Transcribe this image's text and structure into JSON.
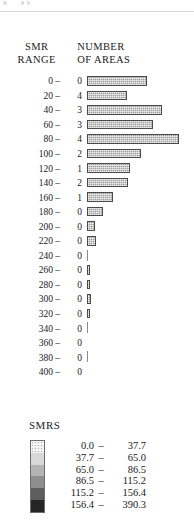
{
  "headers": {
    "smr_range_line1": "SMR",
    "smr_range_line2": "RANGE",
    "number_line1": "NUMBER",
    "number_line2": "OF AREAS"
  },
  "legend": {
    "title": "SMRS",
    "rows": [
      {
        "low": "0.0",
        "dash": "–",
        "high": "37.7",
        "color": "#f2f2f2"
      },
      {
        "low": "37.7",
        "dash": "–",
        "high": "65.0",
        "color": "#d8d8d8"
      },
      {
        "low": "65.0",
        "dash": "–",
        "high": "86.5",
        "color": "#b4b4b4"
      },
      {
        "low": "86.5",
        "dash": "–",
        "high": "115.2",
        "color": "#8e8e8e"
      },
      {
        "low": "115.2",
        "dash": "–",
        "high": "156.4",
        "color": "#5e5e5e"
      },
      {
        "low": "156.4",
        "dash": "–",
        "high": "390.3",
        "color": "#262626"
      }
    ]
  },
  "chart_data": {
    "type": "bar",
    "orientation": "horizontal",
    "title": "",
    "xlabel": "NUMBER OF AREAS",
    "ylabel": "SMR RANGE",
    "xlim": [
      0,
      4
    ],
    "grid": false,
    "legend_position": "bottom",
    "categories": [
      "0 –",
      "20 –",
      "40 –",
      "60 –",
      "80 –",
      "100 –",
      "120 –",
      "140 –",
      "160 –",
      "180 –",
      "200 –",
      "220 –",
      "240 –",
      "260 –",
      "280 –",
      "300 –",
      "320 –",
      "340 –",
      "360 –",
      "380 –",
      "400 –"
    ],
    "values": [
      0,
      4,
      3,
      3,
      4,
      2,
      1,
      2,
      1,
      0,
      0,
      0,
      0,
      0,
      0,
      0,
      0,
      0,
      0,
      0,
      0
    ],
    "bars": [
      {
        "range": "0 –",
        "count": "0",
        "width_px": 60,
        "style": "filled"
      },
      {
        "range": "20 –",
        "count": "4",
        "width_px": 40,
        "style": "filled"
      },
      {
        "range": "40 –",
        "count": "3",
        "width_px": 75,
        "style": "filled"
      },
      {
        "range": "60 –",
        "count": "3",
        "width_px": 66,
        "style": "filled"
      },
      {
        "range": "80 –",
        "count": "4",
        "width_px": 92,
        "style": "filled"
      },
      {
        "range": "100 –",
        "count": "2",
        "width_px": 54,
        "style": "filled"
      },
      {
        "range": "120 –",
        "count": "1",
        "width_px": 43,
        "style": "filled"
      },
      {
        "range": "140 –",
        "count": "2",
        "width_px": 41,
        "style": "filled"
      },
      {
        "range": "160 –",
        "count": "1",
        "width_px": 26,
        "style": "filled"
      },
      {
        "range": "180 –",
        "count": "0",
        "width_px": 16,
        "style": "filled"
      },
      {
        "range": "200 –",
        "count": "0",
        "width_px": 8,
        "style": "filled"
      },
      {
        "range": "220 –",
        "count": "0",
        "width_px": 9,
        "style": "filled"
      },
      {
        "range": "240 –",
        "count": "0",
        "width_px": 1,
        "style": "tick"
      },
      {
        "range": "260 –",
        "count": "0",
        "width_px": 3,
        "style": "filled"
      },
      {
        "range": "280 –",
        "count": "0",
        "width_px": 3,
        "style": "filled"
      },
      {
        "range": "300 –",
        "count": "0",
        "width_px": 4,
        "style": "filled"
      },
      {
        "range": "320 –",
        "count": "0",
        "width_px": 3,
        "style": "filled"
      },
      {
        "range": "340 –",
        "count": "0",
        "width_px": 1,
        "style": "tick"
      },
      {
        "range": "360 –",
        "count": "0",
        "width_px": 0,
        "style": "none"
      },
      {
        "range": "380 –",
        "count": "0",
        "width_px": 1,
        "style": "tick"
      },
      {
        "range": "400 –",
        "count": "0",
        "width_px": 0,
        "style": "none"
      }
    ]
  }
}
